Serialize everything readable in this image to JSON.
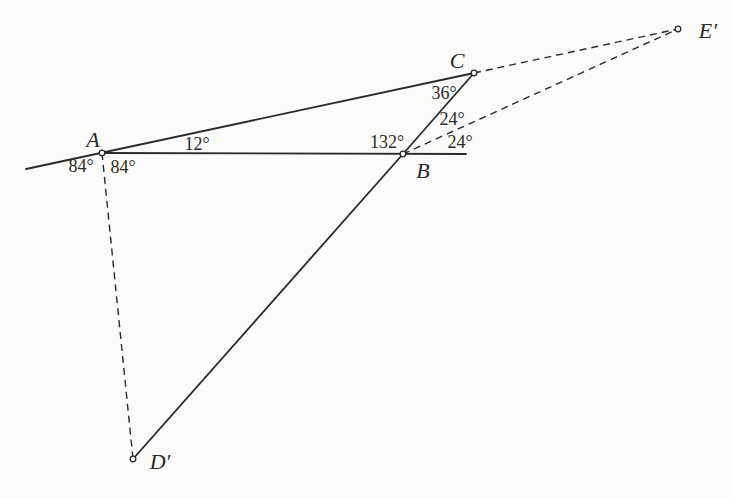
{
  "styles": {
    "background": "#fbfbfa",
    "ink": "#2a2a28",
    "solid_width": 1.8,
    "dashed_width": 1.4,
    "dash_pattern": "7 5",
    "point_radius": 2.8
  },
  "diagram": {
    "points": [
      {
        "id": "A",
        "label": "A",
        "x": 102,
        "y": 153,
        "label_x": 93,
        "label_y": 139
      },
      {
        "id": "B",
        "label": "B",
        "x": 403,
        "y": 154,
        "label_x": 423,
        "label_y": 170
      },
      {
        "id": "C",
        "label": "C",
        "x": 474,
        "y": 73,
        "label_x": 457,
        "label_y": 60
      },
      {
        "id": "Dp",
        "label": "D′",
        "x": 133,
        "y": 459,
        "label_x": 160,
        "label_y": 461
      },
      {
        "id": "Ep",
        "label": "E′",
        "x": 678,
        "y": 29,
        "label_x": 708,
        "label_y": 30
      }
    ],
    "ray_endpoints": [
      {
        "id": "L",
        "x": 26,
        "y": 169
      },
      {
        "id": "R",
        "x": 466,
        "y": 154
      }
    ],
    "segments": [
      {
        "from": "L",
        "to": "C",
        "dashed": false,
        "name": "line-CA-extended-left"
      },
      {
        "from": "A",
        "to": "R",
        "dashed": false,
        "name": "line-AB-extended-right"
      },
      {
        "from": "B",
        "to": "C",
        "dashed": false,
        "name": "segment-BC"
      },
      {
        "from": "B",
        "to": "Dp",
        "dashed": false,
        "name": "segment-B-Dprime"
      },
      {
        "from": "A",
        "to": "Dp",
        "dashed": true,
        "name": "segment-A-Dprime-dashed"
      },
      {
        "from": "C",
        "to": "Ep",
        "dashed": true,
        "name": "segment-C-Eprime-dashed"
      },
      {
        "from": "B",
        "to": "Ep",
        "dashed": true,
        "name": "segment-B-Eprime-dashed"
      }
    ],
    "angle_labels": [
      {
        "name": "angle-12deg-at-A",
        "text": "12°",
        "x": 197,
        "y": 144
      },
      {
        "name": "angle-84deg-left-of-A",
        "text": "84°",
        "x": 81,
        "y": 166
      },
      {
        "name": "angle-84deg-right-of-A",
        "text": "84°",
        "x": 123,
        "y": 167
      },
      {
        "name": "angle-132deg-at-B",
        "text": "132°",
        "x": 387,
        "y": 142
      },
      {
        "name": "angle-36deg-at-C",
        "text": "36°",
        "x": 444,
        "y": 93
      },
      {
        "name": "angle-24deg-upper-at-B",
        "text": "24°",
        "x": 452,
        "y": 119
      },
      {
        "name": "angle-24deg-lower-at-B",
        "text": "24°",
        "x": 460,
        "y": 142
      }
    ]
  }
}
